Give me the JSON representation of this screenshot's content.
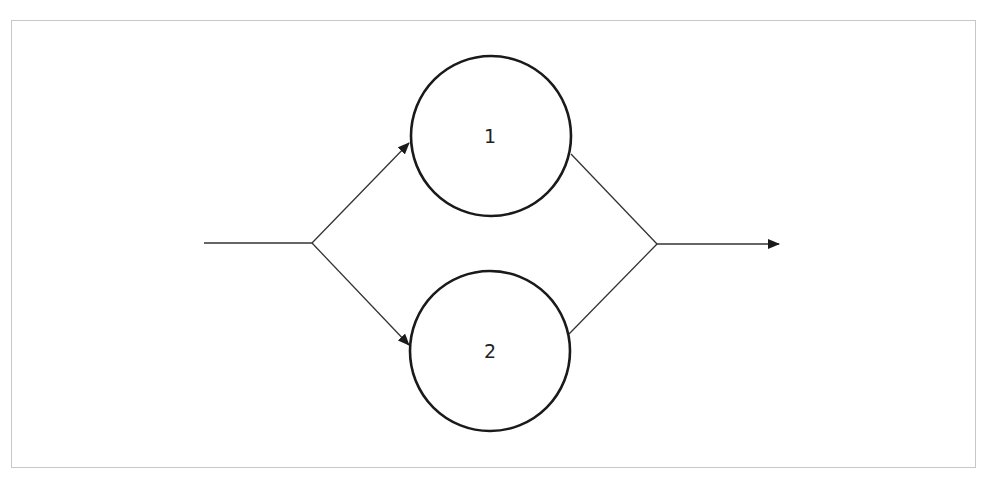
{
  "diagram": {
    "type": "parallel-system",
    "colors": {
      "frame_border": "#c8c8c8",
      "stroke": "#1a1a1a",
      "connector": "#333333",
      "background": "#ffffff"
    },
    "nodes": [
      {
        "id": "node-1",
        "label": "1",
        "cx": 491,
        "cy": 136,
        "r": 80
      },
      {
        "id": "node-2",
        "label": "2",
        "cx": 490,
        "cy": 351,
        "r": 80
      }
    ],
    "edges": [
      {
        "id": "input-line",
        "from": [
          204,
          243
        ],
        "to": [
          312,
          243
        ],
        "arrow": false
      },
      {
        "id": "split-to-1",
        "from": [
          312,
          243
        ],
        "to": [
          409,
          143
        ],
        "arrow": true
      },
      {
        "id": "split-to-2",
        "from": [
          312,
          243
        ],
        "to": [
          409,
          345
        ],
        "arrow": true
      },
      {
        "id": "from-1-to-join",
        "from": [
          571,
          154
        ],
        "to": [
          657,
          244
        ],
        "arrow": false
      },
      {
        "id": "from-2-to-join",
        "from": [
          569,
          334
        ],
        "to": [
          657,
          244
        ],
        "arrow": false
      },
      {
        "id": "output-line",
        "from": [
          657,
          244
        ],
        "to": [
          779,
          244
        ],
        "arrow": true
      }
    ]
  }
}
